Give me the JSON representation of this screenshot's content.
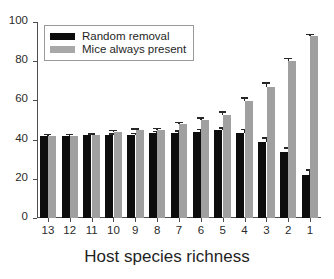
{
  "chart_data": {
    "type": "bar",
    "title": "",
    "subtitle": "",
    "xlabel": "Host species richness",
    "ylabel": "",
    "categories": [
      "13",
      "12",
      "11",
      "10",
      "9",
      "8",
      "7",
      "6",
      "5",
      "4",
      "3",
      "2",
      "1"
    ],
    "ylim": [
      0,
      100
    ],
    "yticks": [
      0,
      20,
      40,
      60,
      80,
      100
    ],
    "ytick_labels": [
      "0",
      "20",
      "40",
      "60",
      "80",
      "100"
    ],
    "grid": false,
    "legend_position": "upper left",
    "error_bars": "standard error",
    "series": [
      {
        "name": "Random removal",
        "color": "#0d0d0d",
        "values": [
          41.8,
          42.0,
          42.2,
          42.2,
          42.5,
          43.5,
          43.5,
          44.0,
          44.8,
          43.5,
          39.0,
          33.5,
          21.8
        ],
        "errors": [
          0.4,
          0.5,
          0.5,
          0.8,
          0.9,
          1.0,
          1.2,
          1.4,
          1.5,
          2.0,
          2.2,
          2.5,
          3.0
        ]
      },
      {
        "name": "Mice always present",
        "color": "#a0a0a0",
        "values": [
          41.8,
          42.0,
          42.3,
          44.0,
          44.7,
          45.0,
          47.8,
          49.8,
          52.8,
          59.8,
          67.0,
          80.0,
          93.0
        ],
        "errors": [
          0.4,
          0.5,
          0.6,
          0.8,
          1.0,
          1.0,
          1.3,
          1.6,
          1.7,
          1.8,
          2.2,
          1.8,
          0.6
        ]
      }
    ]
  },
  "legend": {
    "entries": [
      {
        "label": "Random removal",
        "swatch": "black"
      },
      {
        "label": "Mice always present",
        "swatch": "gray"
      }
    ]
  },
  "axes": {
    "x_title": "Host species richness"
  }
}
